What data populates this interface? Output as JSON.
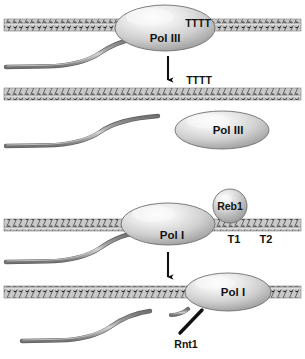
{
  "figure": {
    "background_color": "#ffffff",
    "width": 305,
    "height": 359
  },
  "colors": {
    "dna_band_fill": "#c9c9c9",
    "dna_zigzag": "#3a3a3a",
    "dna_outline": "#7a7a7a",
    "protein_fill_light": "#f2f2f2",
    "protein_fill_mid": "#c2c2c2",
    "protein_fill_dark": "#8e8e8e",
    "protein_outline": "#6e6e6e",
    "rna_strand": "#8a8a8a",
    "rna_strand_edge": "#5d5d5d",
    "arrow": "#111111",
    "text": "#131313"
  },
  "panels": {
    "pol3": {
      "name": "RNA polymerase III termination",
      "before": {
        "polymerase_label": "Pol III",
        "terminator_label": "TTTT",
        "dna_label": "dna-duplex",
        "rna_label": "nascent-rna-transcript"
      },
      "transition": {
        "arrow_label": "termination-arrow",
        "released_transcript_label": "TTTT"
      },
      "after": {
        "polymerase_label": "Pol III",
        "dna_label": "dna-duplex",
        "rna_label": "released-rna-transcript"
      }
    },
    "pol1": {
      "name": "RNA polymerase I termination",
      "before": {
        "polymerase_label": "Pol I",
        "factor_label": "Reb1",
        "site_labels": [
          "T1",
          "T2"
        ],
        "dna_label": "dna-duplex",
        "rna_label": "nascent-rna-transcript"
      },
      "transition": {
        "arrow_label": "termination-arrow"
      },
      "after": {
        "polymerase_label": "Pol I",
        "nuclease_label": "Rnt1",
        "dna_label": "dna-duplex",
        "rna_label": "cleaved-rna-transcript"
      }
    }
  }
}
